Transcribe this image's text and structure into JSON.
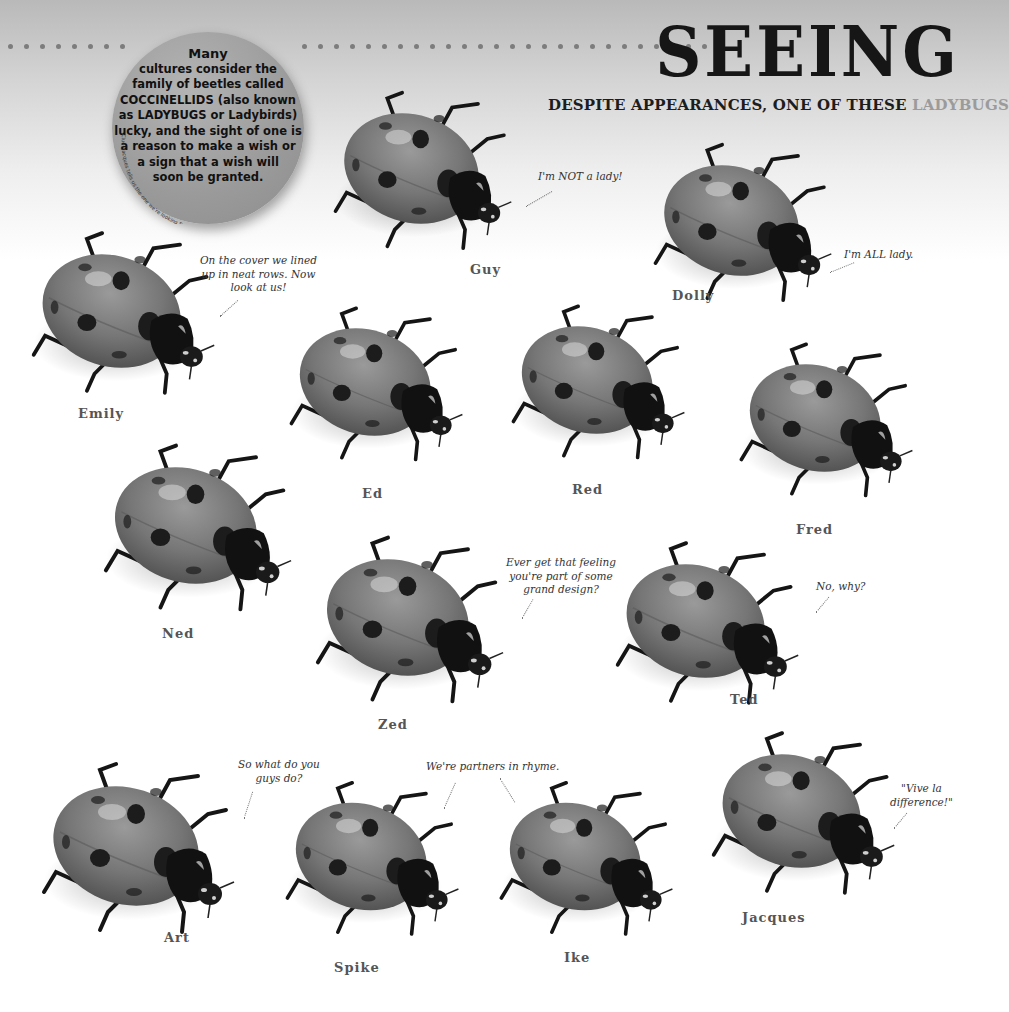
{
  "header": {
    "title": "SEEING",
    "subtitle_main": "DESPITE APPEARANCES, ONE OF THESE ",
    "subtitle_highlight": "LADYBUGS"
  },
  "info_circle": {
    "lead": "Many",
    "lines": [
      "cultures consider the",
      "family of beetles called",
      "COCCINELLIDS (also known",
      "as LADYBUGS or Ladybirds)",
      "lucky, and the sight of one is",
      "a reason to make a wish or",
      "a sign that a wish will",
      "soon be granted."
    ],
    "clue": "Clue: Jacques tells us the one we're looking for (hidden clue)"
  },
  "ladybugs": [
    {
      "name": "Emily",
      "speech": "On the cover we lined\nup in neat rows. Now\nlook at us!"
    },
    {
      "name": "Guy",
      "speech": "I'm NOT a lady!"
    },
    {
      "name": "Dolly",
      "speech": "I'm ALL lady."
    },
    {
      "name": "Ed",
      "speech": ""
    },
    {
      "name": "Red",
      "speech": ""
    },
    {
      "name": "Fred",
      "speech": ""
    },
    {
      "name": "Ned",
      "speech": ""
    },
    {
      "name": "Zed",
      "speech": "Ever get that feeling\nyou're part of some\ngrand design?"
    },
    {
      "name": "Ted",
      "speech": "No, why?"
    },
    {
      "name": "Art",
      "speech": "So what do you\nguys do?"
    },
    {
      "name": "Spike",
      "speech": "We're partners in rhyme."
    },
    {
      "name": "Ike",
      "speech": ""
    },
    {
      "name": "Jacques",
      "speech": "\"Vive la\ndifference!\""
    }
  ],
  "colors": {
    "title": "#161616",
    "subtitle_highlight": "#9b9b9b",
    "circle": "#9a9a9a",
    "name_label": "#555555"
  }
}
